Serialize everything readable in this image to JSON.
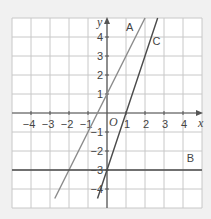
{
  "chart_data": {
    "type": "line",
    "title": "",
    "xlabel": "x",
    "ylabel": "y",
    "origin_label": "O",
    "xlim": [
      -5,
      5
    ],
    "ylim": [
      -5,
      5
    ],
    "grid": true,
    "x_ticks": [
      -4,
      -3,
      -2,
      -1,
      1,
      2,
      3,
      4
    ],
    "y_ticks": [
      4,
      3,
      2,
      1,
      -1,
      -2,
      -3,
      -4
    ],
    "x_tick_labels": [
      "−4",
      "−3",
      "−2",
      "−1",
      "1",
      "2",
      "3",
      "4"
    ],
    "y_tick_labels": [
      "4",
      "3",
      "2",
      "1",
      "−1",
      "−2",
      "−3",
      "−4"
    ],
    "series": [
      {
        "name": "A",
        "equation": "y = 2x + 1",
        "slope": 2,
        "intercept": 1,
        "color": "#8a8a8a",
        "x": [
          -2.75,
          2
        ],
        "y": [
          -4.5,
          5
        ]
      },
      {
        "name": "B",
        "equation": "y = -3",
        "slope": 0,
        "intercept": -3,
        "color": "#4a4a4a",
        "x": [
          -5,
          5
        ],
        "y": [
          -3,
          -3
        ]
      },
      {
        "name": "C",
        "equation": "y = 3x - 3",
        "slope": 3,
        "intercept": -3,
        "color": "#4a4a4a",
        "x": [
          -0.5,
          2.667
        ],
        "y": [
          -4.5,
          5
        ]
      }
    ],
    "annotations": [
      {
        "text": "A",
        "x": 1.0,
        "y": 4.3
      },
      {
        "text": "B",
        "x": 4.2,
        "y": -2.6
      },
      {
        "text": "C",
        "x": 2.4,
        "y": 3.6
      }
    ]
  },
  "colors": {
    "background": "#f1f1f1",
    "plot_bg": "#ffffff",
    "grid": "#c8c8c8",
    "axis": "#555555"
  }
}
